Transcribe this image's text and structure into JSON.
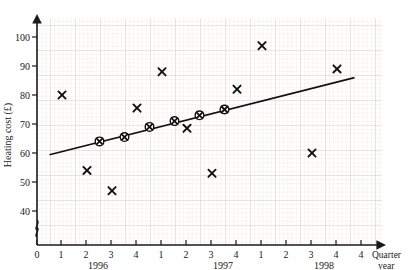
{
  "chart_data": {
    "type": "scatter",
    "title": "",
    "xlabel": "Quarter",
    "xlabel2": "year",
    "ylabel": "Heating cost (£)",
    "ylim": [
      36,
      105
    ],
    "yticks": [
      40,
      50,
      60,
      70,
      80,
      90,
      100
    ],
    "y_axis_break": true,
    "grid": true,
    "grid_minor": true,
    "x_axis": {
      "origin_label": "0",
      "quarter_ticks": [
        "1",
        "2",
        "3",
        "4",
        "1",
        "2",
        "3",
        "4",
        "1",
        "2",
        "3",
        "4"
      ],
      "years": [
        "1996",
        "1997",
        "1998"
      ],
      "quarters_per_year": 4
    },
    "series": [
      {
        "name": "Quarterly heating cost",
        "marker": "x",
        "points": [
          {
            "q": 1,
            "year": "1996",
            "t": 1,
            "value": 80
          },
          {
            "q": 2,
            "year": "1996",
            "t": 2,
            "value": 54
          },
          {
            "q": 3,
            "year": "1996",
            "t": 3,
            "value": 47
          },
          {
            "q": 4,
            "year": "1996",
            "t": 4,
            "value": 75.5
          },
          {
            "q": 1,
            "year": "1997",
            "t": 5,
            "value": 88
          },
          {
            "q": 2,
            "year": "1997",
            "t": 6,
            "value": 68.5
          },
          {
            "q": 3,
            "year": "1997",
            "t": 7,
            "value": 53
          },
          {
            "q": 4,
            "year": "1997",
            "t": 8,
            "value": 82
          },
          {
            "q": 1,
            "year": "1998",
            "t": 9,
            "value": 97
          },
          {
            "q": 3,
            "year": "1998",
            "t": 11,
            "value": 60
          },
          {
            "q": 4,
            "year": "1998",
            "t": 12,
            "value": 89
          }
        ]
      },
      {
        "name": "Four-point moving average",
        "marker": "circled-x",
        "points": [
          {
            "t": 2.5,
            "value": 64
          },
          {
            "t": 3.5,
            "value": 65.5
          },
          {
            "t": 4.5,
            "value": 69
          },
          {
            "t": 5.5,
            "value": 71
          },
          {
            "t": 6.5,
            "value": 73
          },
          {
            "t": 7.5,
            "value": 75
          }
        ]
      }
    ],
    "trend_line": {
      "name": "trend line",
      "x_start": 0.5,
      "y_start": 59.4,
      "x_end": 12.7,
      "y_end": 86.0
    }
  }
}
